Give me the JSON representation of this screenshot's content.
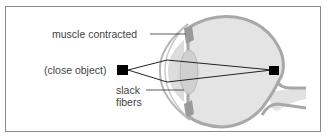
{
  "diagram": {
    "type": "eye-accommodation",
    "labels": {
      "muscle": "muscle contracted",
      "object": "(close object)",
      "slack_line1": "slack",
      "slack_line2": "fibers"
    },
    "colors": {
      "sclera": "#a8a8a8",
      "eye_fill": "#e4e4e4",
      "lens": "#d2d2d2",
      "muscle": "#9a9a9a",
      "ray": "#222222",
      "object": "#000000",
      "text": "#444444",
      "frame": "#8a8a8a"
    }
  }
}
